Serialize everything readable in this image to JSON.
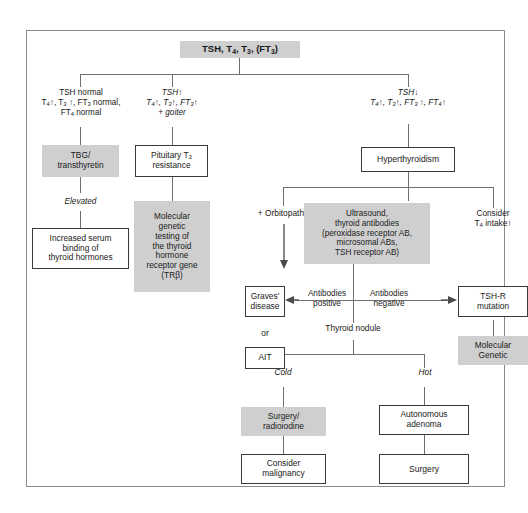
{
  "diagram": {
    "title_node": "TSH, T4, T3, (FT3)",
    "branches": {
      "left": {
        "criteria_line1": "TSH normal",
        "criteria_line2": "T4↑, T3 ↑, FT3 normal,",
        "criteria_line3": "FT4 normal",
        "grey_box": "TBG/ transthyretin",
        "edge_label": "Elevated",
        "outcome": "Increased serum binding of thyroid hormones"
      },
      "middle": {
        "criteria_line1": "TSH↑",
        "criteria_line2": "T4↑, T3↑, FT3↑",
        "criteria_line3": "+ goiter",
        "box": "Pituitary T3 resistance",
        "grey_box": "Molecular genetic testing of the thyroid hormone receptor gene (TRβ)"
      },
      "right": {
        "criteria_line1": "TSH↓",
        "criteria_line2": "T4↑, T3↑, FT3 ↑, FT4↑",
        "box": "Hyperthyroidism"
      }
    },
    "hyper_branches": {
      "orbitopathy_label": "+ Orbitopathy",
      "workup_grey_box": "Ultrasound, thyroid antibodies (peroxidase receptor AB, microsomal ABs, TSH receptor AB)",
      "consider_label": "Consider T4 intake↑"
    },
    "antibody_results": {
      "positive_label": "Antibodies positive",
      "negative_label": "Antibodies negative",
      "graves_box": "Graves' disease",
      "or_label": "or",
      "ait_box": "AIT",
      "tshr_box": "TSH-R mutation",
      "molecular_grey_box": "Molecular Genetic"
    },
    "nodule": {
      "heading": "Thyroid nodule",
      "cold_label": "Cold",
      "hot_label": "Hot",
      "cold_grey_box": "Surgery/ radioiodine",
      "cold_outcome_box": "Consider malignancy",
      "hot_box": "Autonomous adenoma",
      "hot_outcome_box": "Surgery"
    },
    "colors": {
      "grey_fill": "#cfcfcf",
      "box_border": "#3a3a3a",
      "connector": "#6f6f6f",
      "frame_border": "#8a8a8a",
      "text": "#1a1a1a"
    }
  }
}
